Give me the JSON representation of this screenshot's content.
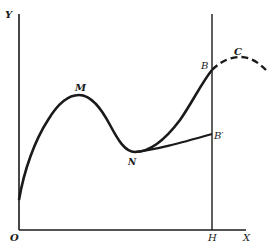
{
  "diagram": {
    "type": "curve-on-axes",
    "axes": {
      "x_label": "X",
      "y_label": "Y",
      "origin_label": "O"
    },
    "vertical_line_label": "H",
    "points": [
      {
        "id": "M",
        "label": "M",
        "description": "local maximum of curve"
      },
      {
        "id": "N",
        "label": "N",
        "description": "local minimum of curve"
      },
      {
        "id": "B",
        "label": "B",
        "description": "curve meets vertical line at H"
      },
      {
        "id": "B_prime",
        "label": "B′",
        "description": "end of alternate branch from N at vertical line"
      },
      {
        "id": "C",
        "label": "C",
        "description": "maximum on dashed continuation beyond B"
      }
    ],
    "paths": [
      {
        "name": "main-curve",
        "style": "solid",
        "through": [
          "start-on-Y-axis",
          "M",
          "N",
          "B"
        ]
      },
      {
        "name": "alternate-branch",
        "style": "solid",
        "through": [
          "N",
          "B′"
        ]
      },
      {
        "name": "continuation",
        "style": "dashed",
        "through": [
          "B",
          "C"
        ]
      }
    ],
    "colors": {
      "ink": "#1a1a1a",
      "background": "#ffffff"
    }
  }
}
